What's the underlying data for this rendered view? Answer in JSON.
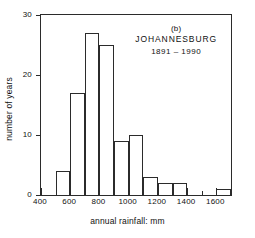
{
  "chart_data": {
    "type": "bar",
    "title": "",
    "subtitle": "",
    "xlabel": "annual rainfall: mm",
    "ylabel": "number of years",
    "xlim": [
      400,
      1700
    ],
    "ylim": [
      0,
      30
    ],
    "grid": false,
    "legend": null,
    "bin_width": 100,
    "bin_edges": [
      400,
      500,
      600,
      700,
      800,
      900,
      1000,
      1100,
      1200,
      1300,
      1400,
      1500,
      1600,
      1700
    ],
    "categories": [
      "400-500",
      "500-600",
      "600-700",
      "700-800",
      "800-900",
      "900-1000",
      "1000-1100",
      "1100-1200",
      "1200-1300",
      "1300-1400",
      "1400-1500",
      "1500-1600",
      "1600-1700"
    ],
    "values": [
      0,
      4,
      17,
      27,
      25,
      9,
      10,
      3,
      2,
      2,
      0,
      0,
      1
    ],
    "xticks_major": [
      400,
      600,
      800,
      1000,
      1200,
      1400,
      1600
    ],
    "xticks_major_labels": [
      "400",
      "600",
      "800",
      "1000",
      "1200",
      "1400",
      "1600"
    ],
    "xticks_minor": [
      500,
      700,
      900,
      1100,
      1300,
      1500,
      1700
    ],
    "yticks": [
      0,
      10,
      20,
      30
    ],
    "ytick_labels": [
      "0",
      "10",
      "20",
      "30"
    ],
    "annotations": {
      "panel_id": "(b)",
      "station": "JOHANNESBURG",
      "period": "1891 – 1990"
    },
    "colors": {
      "axis": "#2b2b2b",
      "bar_stroke": "#2b2b2b",
      "bar_fill": "none",
      "background": "#ffffff",
      "text": "#111111"
    }
  }
}
